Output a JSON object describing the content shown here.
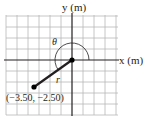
{
  "figure": {
    "x_axis_label": "x (m)",
    "y_axis_label": "y (m)",
    "angle_label": "θ",
    "vector_label": "r",
    "point_label": "(−3.50, −2.50)",
    "point": {
      "x": -3.5,
      "y": -2.5
    },
    "grid_spacing_m": 1,
    "grid_extent": {
      "x": [
        -6,
        4
      ],
      "y": [
        -5,
        4
      ]
    },
    "colors": {
      "grid": "#b8b8b8",
      "axis": "#231f20",
      "vector": "#231f20",
      "arc": "#231f20",
      "text": "#231f20",
      "background": "#ffffff"
    }
  }
}
